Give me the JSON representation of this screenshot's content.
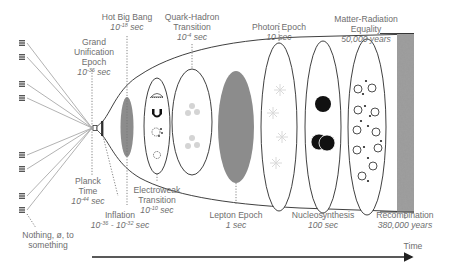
{
  "diagram": {
    "axis_label": "Time",
    "origin_label": "Nothing, ø, to something",
    "stages": [
      {
        "name": "Planck Time",
        "line1": "Planck",
        "line2": "Time",
        "time": "10",
        "exp": "-44",
        "unit": " sec"
      },
      {
        "name": "Inflation",
        "line1": "Inflation",
        "time_a": "10",
        "exp_a": "-36",
        "sep": " - ",
        "time_b": "10",
        "exp_b": "-32",
        "unit": " sec"
      },
      {
        "name": "Grand Unification Epoch",
        "line1": "Grand",
        "line2": "Unification",
        "line3": "Epoch",
        "time": "10",
        "exp": "-36",
        "unit": " sec"
      },
      {
        "name": "Hot Big Bang",
        "line1": "Hot Big Bang",
        "time": "10",
        "exp": "-18",
        "unit": " sec"
      },
      {
        "name": "Electroweak Transition",
        "line1": "Electroweak",
        "line2": "Transition",
        "time": "10",
        "exp": "-10",
        "unit": " sec"
      },
      {
        "name": "Quark-Hadron Transition",
        "line1": "Quark-Hadron",
        "line2": "Transition",
        "time": "10",
        "exp": "-4",
        "unit": " sec"
      },
      {
        "name": "Lepton Epoch",
        "line1": "Lepton Epoch",
        "time": "1 sec"
      },
      {
        "name": "Photon Epoch",
        "line1": "Photon Epoch",
        "time": "10 sec"
      },
      {
        "name": "Nucleosynthesis",
        "line1": "Nucleosynthesis",
        "time": "100 sec"
      },
      {
        "name": "Matter-Radiation Equality",
        "line1": "Matter-Radiation",
        "line2": "Equality",
        "time": "50,000 years"
      },
      {
        "name": "Recombination",
        "line1": "Recombination",
        "time": "380,000 years"
      }
    ],
    "colors": {
      "outline": "#2a2a2a",
      "label": "#6e6e6e",
      "gray_fill": "#8c8c8c",
      "cmb_band": "#7a7a7a",
      "faint_particle": "#d6d6d6"
    }
  }
}
